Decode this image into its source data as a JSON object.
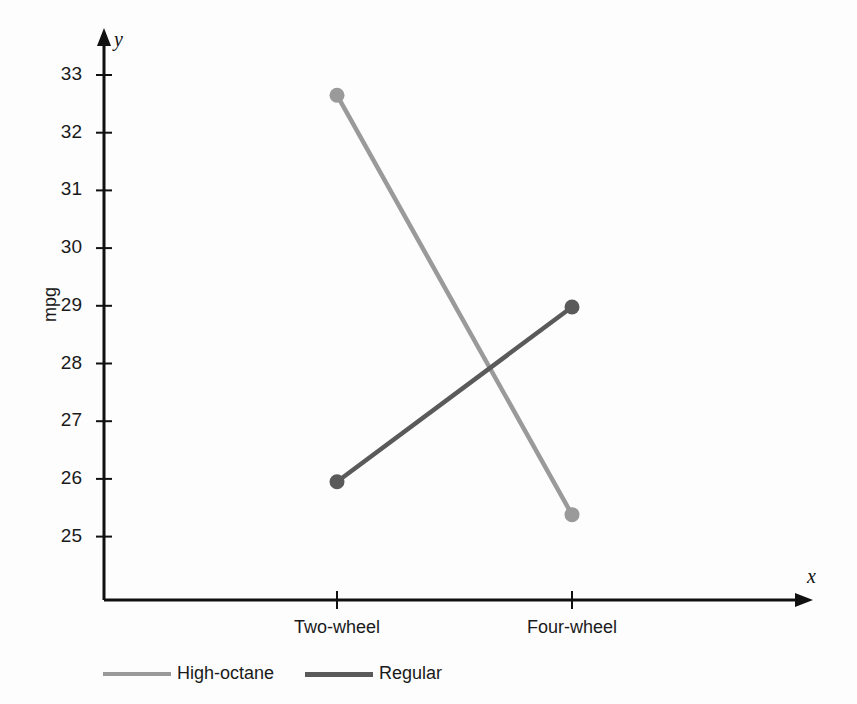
{
  "chart_data": {
    "type": "line",
    "title": "",
    "subtitle": "",
    "xlabel": "x",
    "ylabel": "mpg",
    "y_axis_name": "y",
    "categories": [
      "Two-wheel",
      "Four-wheel"
    ],
    "yticks": [
      33,
      32,
      31,
      30,
      29,
      28,
      27,
      26,
      25
    ],
    "ytick_labels": [
      "33",
      "32",
      "31",
      "30",
      "29",
      "28",
      "27",
      "26",
      "25"
    ],
    "ylim": [
      24.2,
      33.6
    ],
    "grid": false,
    "legend_position": "bottom-left",
    "markers": "filled-circle",
    "series": [
      {
        "name": "High-octane",
        "values": [
          32.65,
          25.38
        ],
        "color": "#9a9a9a"
      },
      {
        "name": "Regular",
        "values": [
          25.95,
          28.98
        ],
        "color": "#5a5a5a"
      }
    ],
    "annotations": []
  },
  "axes": {
    "x_arrow": true,
    "y_arrow": true,
    "axis_color": "#111111"
  },
  "legend": {
    "entries": [
      {
        "label": "High-octane",
        "color": "#9a9a9a"
      },
      {
        "label": "Regular",
        "color": "#5a5a5a"
      }
    ]
  }
}
